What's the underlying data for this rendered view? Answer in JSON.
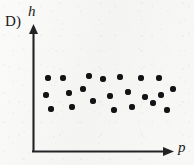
{
  "option": {
    "label": "D)"
  },
  "axes": {
    "y_label": "h",
    "x_label": "p",
    "origin": {
      "x": 33,
      "y": 152
    },
    "y_top": 26,
    "x_right": 172,
    "line_color": "#232326",
    "arrowheads": true
  },
  "style": {
    "background": "#f7f7f5",
    "ink": "#19191b",
    "dot_color": "#131316",
    "dot_diameter_px": 6.2
  },
  "chart_data": {
    "type": "scatter",
    "title": "",
    "xlabel": "p",
    "ylabel": "h",
    "grid": false,
    "legend": null,
    "axis_units": "none",
    "tick_labels": {
      "x": [],
      "y": []
    },
    "relationship": "no correlation",
    "n_points": 20,
    "points": [
      {
        "x": 48,
        "y": 78
      },
      {
        "x": 63,
        "y": 78
      },
      {
        "x": 89,
        "y": 76
      },
      {
        "x": 103,
        "y": 79
      },
      {
        "x": 120,
        "y": 77
      },
      {
        "x": 141,
        "y": 78
      },
      {
        "x": 159,
        "y": 78
      },
      {
        "x": 46,
        "y": 95
      },
      {
        "x": 69,
        "y": 93
      },
      {
        "x": 83,
        "y": 89
      },
      {
        "x": 110,
        "y": 96
      },
      {
        "x": 128,
        "y": 92
      },
      {
        "x": 145,
        "y": 97
      },
      {
        "x": 161,
        "y": 95
      },
      {
        "x": 173,
        "y": 89
      },
      {
        "x": 51,
        "y": 109
      },
      {
        "x": 72,
        "y": 107
      },
      {
        "x": 93,
        "y": 101
      },
      {
        "x": 114,
        "y": 110
      },
      {
        "x": 132,
        "y": 107
      },
      {
        "x": 153,
        "y": 103
      },
      {
        "x": 167,
        "y": 110
      }
    ]
  }
}
